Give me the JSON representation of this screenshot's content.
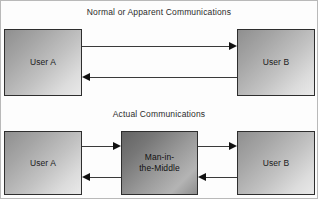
{
  "diagram": {
    "sections": [
      {
        "id": "normal",
        "title": "Normal or Apparent Communications"
      },
      {
        "id": "actual",
        "title": "Actual Communications"
      }
    ],
    "nodes": {
      "user_a_top": "User A",
      "user_b_top": "User B",
      "user_a_bottom": "User A",
      "user_b_bottom": "User B",
      "mitm_line1": "Man-in-",
      "mitm_line2": "the-Middle"
    },
    "arrows": [
      {
        "id": "a-to-b-top",
        "from": "User A",
        "to": "User B",
        "direction": "right"
      },
      {
        "id": "b-to-a-top",
        "from": "User B",
        "to": "User A",
        "direction": "left"
      },
      {
        "id": "a-to-mitm",
        "from": "User A",
        "to": "Man-in-the-Middle",
        "direction": "right"
      },
      {
        "id": "mitm-to-a",
        "from": "Man-in-the-Middle",
        "to": "User A",
        "direction": "left"
      },
      {
        "id": "mitm-to-b",
        "from": "Man-in-the-Middle",
        "to": "User B",
        "direction": "right"
      },
      {
        "id": "b-to-mitm",
        "from": "User B",
        "to": "Man-in-the-Middle",
        "direction": "left"
      }
    ],
    "colors": {
      "background": "#fdfdfd",
      "border": "#b9b9b9",
      "node_stroke": "#2e2e2e",
      "arrow": "#111111",
      "text": "#202020",
      "node_fill_light": "#e9e9e9",
      "node_fill_dark": "#8f8f8f",
      "mitm_fill_dark": "#636363"
    }
  }
}
